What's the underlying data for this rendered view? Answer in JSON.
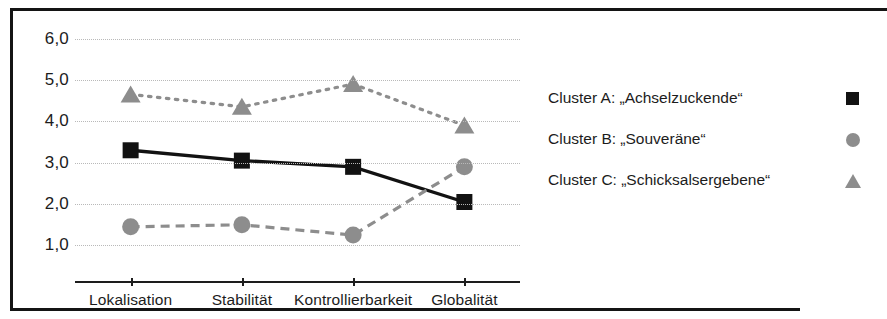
{
  "chart_data": {
    "type": "line",
    "title": "",
    "subtitle": "",
    "xlabel": "",
    "ylabel": "",
    "categories": [
      "Lokalisation",
      "Stabilität",
      "Kontrollierbarkeit",
      "Globalität"
    ],
    "ylim": [
      0.6,
      6.4
    ],
    "yticks": [
      1.0,
      2.0,
      3.0,
      4.0,
      5.0,
      6.0
    ],
    "ytick_labels": [
      "1,0",
      "2,0",
      "3,0",
      "4,0",
      "5,0",
      "6,0"
    ],
    "grid": true,
    "grid_style": "dotted",
    "legend_position": "right",
    "series": [
      {
        "name": "Cluster A: „Achselzuckende“",
        "marker": "square",
        "line_style": "solid",
        "color": "#121212",
        "values": [
          3.3,
          3.05,
          2.9,
          2.05
        ]
      },
      {
        "name": "Cluster B: „Souveräne“",
        "marker": "circle",
        "line_style": "dashed",
        "color": "#8d8d8d",
        "values": [
          1.45,
          1.5,
          1.25,
          2.9
        ]
      },
      {
        "name": "Cluster C: „Schicksalsergebene“",
        "marker": "triangle",
        "line_style": "dotted",
        "color": "#8d8d8d",
        "values": [
          4.65,
          4.35,
          4.9,
          3.9
        ]
      }
    ]
  },
  "legend": {
    "items": [
      {
        "label": "Cluster A: „Achselzuckende“",
        "marker": "square-marker-icon"
      },
      {
        "label": "Cluster B: „Souveräne“",
        "marker": "circle-marker-icon"
      },
      {
        "label": "Cluster C: „Schicksalsergebene“",
        "marker": "triangle-marker-icon"
      }
    ]
  },
  "colors": {
    "series_a": "#121212",
    "series_b": "#8d8d8d",
    "series_c": "#8d8d8d",
    "frame": "#141414",
    "grid": "#b9b9b9",
    "text": "#1c1c1c",
    "background": "#ffffff"
  }
}
